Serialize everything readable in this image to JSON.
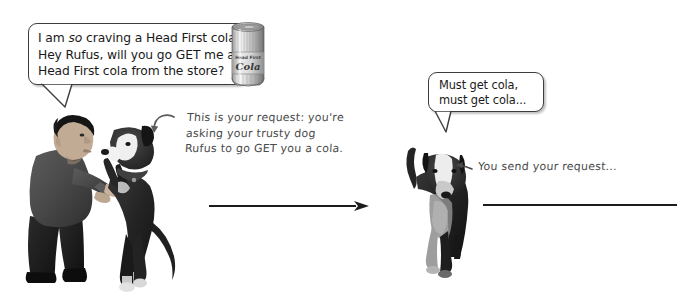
{
  "page": {
    "background_color": "#ffffff",
    "width": 677,
    "height": 297
  },
  "bubbles": [
    {
      "id": "left-request-bubble",
      "speaker": "man",
      "line1_pre": "I am ",
      "line1_italic": "so",
      "line1_post": " craving a Head First cola...",
      "line2": "Hey Rufus, will you go GET me a",
      "line3": "Head First cola from the store?",
      "full_text": "I am so craving a Head First cola... Hey Rufus, will you go GET me a Head First cola from the store?"
    },
    {
      "id": "right-dog-bubble",
      "speaker": "dog",
      "line1": "Must get cola,",
      "line2": "must get cola...",
      "full_text": "Must get cola, must get cola..."
    }
  ],
  "annotations": [
    {
      "id": "request-annotation",
      "arrow": "curved-arrow-down-left-icon",
      "line1": "This is your request: you're",
      "line2": "asking your trusty dog",
      "line3": "Rufus to go GET you a cola.",
      "full_text": "This is your request: you're asking your trusty dog Rufus to go GET you a cola."
    },
    {
      "id": "send-annotation",
      "arrow": "small-arrow-left-icon",
      "line1": "You send your request...",
      "full_text": "You send your request..."
    }
  ],
  "artwork": {
    "cola_can": {
      "name": "head-first-cola-can",
      "brand_small": "Head First",
      "brand_large": "Cola"
    },
    "man_with_dog": {
      "name": "man-asking-dog-photo",
      "description": "Man bending forward holding paws of a black and white dog standing on hind legs"
    },
    "dog_running": {
      "name": "dog-running-photo",
      "description": "Black and white dog walking forward toward viewer"
    }
  },
  "connectors": [
    {
      "id": "request-arrow",
      "type": "arrow-right",
      "color": "#1c1c1c"
    },
    {
      "id": "continuation-rule",
      "type": "line",
      "color": "#1c1c1c"
    }
  ]
}
